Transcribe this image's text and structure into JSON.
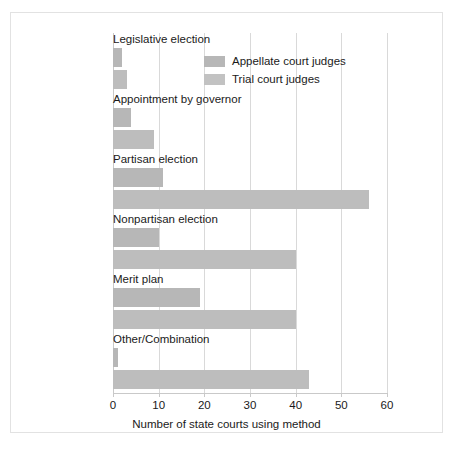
{
  "chart_data": {
    "type": "bar",
    "orientation": "horizontal",
    "title": "",
    "xlabel": "Number of state courts using method",
    "ylabel": "",
    "xlim": [
      0,
      60
    ],
    "xticks": [
      0,
      10,
      20,
      30,
      40,
      50,
      60
    ],
    "grid": true,
    "legend_position": "top-right-inside",
    "categories": [
      "Legislative election",
      "Appointment by governor",
      "Partisan election",
      "Nonpartisan election",
      "Merit plan",
      "Other/Combination"
    ],
    "series": [
      {
        "name": "Appellate court judges",
        "color": "#b7b7b7",
        "values": [
          2,
          4,
          11,
          10,
          19,
          1
        ]
      },
      {
        "name": "Trial court judges",
        "color": "#bdbdbd",
        "values": [
          3,
          9,
          56,
          40,
          40,
          43
        ]
      }
    ]
  },
  "legend": {
    "items": [
      {
        "label": "Appellate court judges"
      },
      {
        "label": "Trial court judges"
      }
    ]
  },
  "axis": {
    "tick_labels": [
      "0",
      "10",
      "20",
      "30",
      "40",
      "50",
      "60"
    ],
    "x_title": "Number of state courts using method"
  }
}
